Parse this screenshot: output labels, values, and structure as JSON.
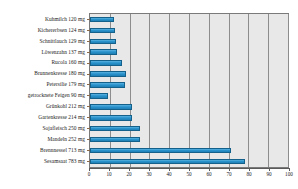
{
  "chart_data": {
    "type": "bar",
    "orientation": "horizontal",
    "title": "",
    "xlabel": "",
    "ylabel": "",
    "xlim": [
      0,
      100
    ],
    "grid": true,
    "legend": false,
    "bar_color": "#2a93cc",
    "bar_border_color": "#14628c",
    "plot_background": "#e8e8e8",
    "xticks": [
      0,
      10,
      20,
      30,
      40,
      50,
      60,
      70,
      80,
      90,
      100
    ],
    "categories": [
      "Kuhmilch 120 mg",
      "Kichererbsen 124 mg",
      "Schnittlauch 129 mg",
      "Löwenzahn 137 mg",
      "Rucola 160 mg",
      "Brunnenkresse 180 mg",
      "Petersilie 179 mg",
      "getrocknete Feigen 90 mg",
      "Grünkohl 212 mg",
      "Gartenkresse 214 mg",
      "Sojafleisch 250 mg",
      "Mandeln 252 mg",
      "Brennnessel 713 mg",
      "Sesamsaat 783 mg"
    ],
    "values": [
      12,
      12.4,
      12.9,
      13.7,
      16,
      18,
      17.9,
      9,
      21.2,
      21.4,
      25,
      25.2,
      71.3,
      78.3
    ],
    "value_labels_mg": [
      120,
      124,
      129,
      137,
      160,
      180,
      179,
      90,
      212,
      214,
      250,
      252,
      713,
      783
    ]
  },
  "axis": {
    "tick_labels": [
      "0",
      "10",
      "20",
      "30",
      "40",
      "50",
      "60",
      "70",
      "80",
      "90",
      "100"
    ]
  }
}
